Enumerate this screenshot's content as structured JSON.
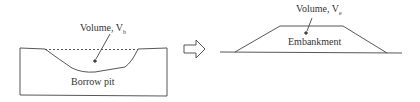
{
  "left": {
    "volume_label": "Volume, V",
    "volume_sub": "b",
    "pit_label": "Borrow pit"
  },
  "right": {
    "volume_label": "Volume, V",
    "volume_sub": "e",
    "embankment_label": "Embankment"
  },
  "arrow": {
    "direction": "right"
  },
  "colors": {
    "stroke": "#444444",
    "background": "#ffffff"
  }
}
